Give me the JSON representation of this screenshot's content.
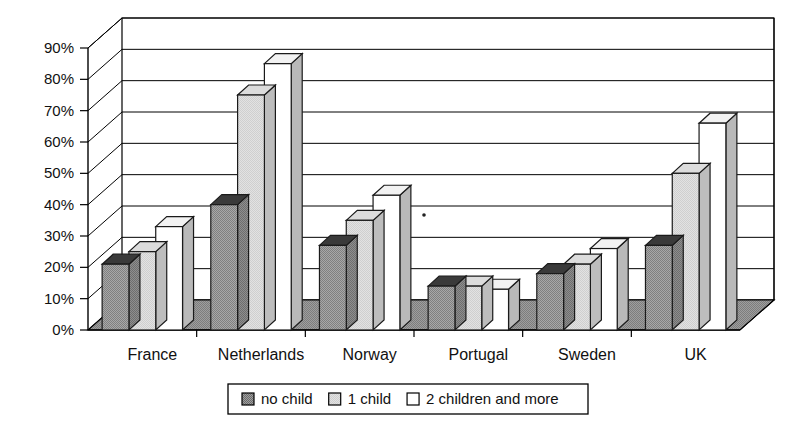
{
  "chart_data": {
    "type": "bar",
    "title": "",
    "subtitle": "",
    "xlabel": "",
    "ylabel": "",
    "categories": [
      "France",
      "Netherlands",
      "Norway",
      "Portugal",
      "Sweden",
      "UK"
    ],
    "series": [
      {
        "name": "no child",
        "values": [
          21,
          40,
          27,
          14,
          18,
          27
        ],
        "color": "#9a9a9a"
      },
      {
        "name": "1 child",
        "values": [
          25,
          75,
          35,
          14,
          21,
          50
        ],
        "color": "#d9d9d9"
      },
      {
        "name": "2 children and more",
        "values": [
          33,
          85,
          43,
          13,
          26,
          66
        ],
        "color": "#ffffff"
      }
    ],
    "ylim": [
      0,
      90
    ],
    "yticks": [
      0,
      10,
      20,
      30,
      40,
      50,
      60,
      70,
      80,
      90
    ],
    "ytick_labels": [
      "0%",
      "10%",
      "20%",
      "30%",
      "40%",
      "50%",
      "60%",
      "70%",
      "80%",
      "90%"
    ],
    "grid": true,
    "legend_position": "bottom",
    "three_d": true,
    "value_format": "percent"
  },
  "legend": {
    "entries": [
      {
        "label": "no child",
        "swatch": "#9a9a9a"
      },
      {
        "label": "1 child",
        "swatch": "#d9d9d9"
      },
      {
        "label": "2 children and more",
        "swatch": "#ffffff"
      }
    ]
  },
  "axes": {
    "y_tick_labels": [
      "90%",
      "80%",
      "70%",
      "60%",
      "50%",
      "40%",
      "30%",
      "20%",
      "10%",
      "0%"
    ],
    "x_category_labels": [
      "France",
      "Netherlands",
      "Norway",
      "Portugal",
      "Sweden",
      "UK"
    ]
  }
}
